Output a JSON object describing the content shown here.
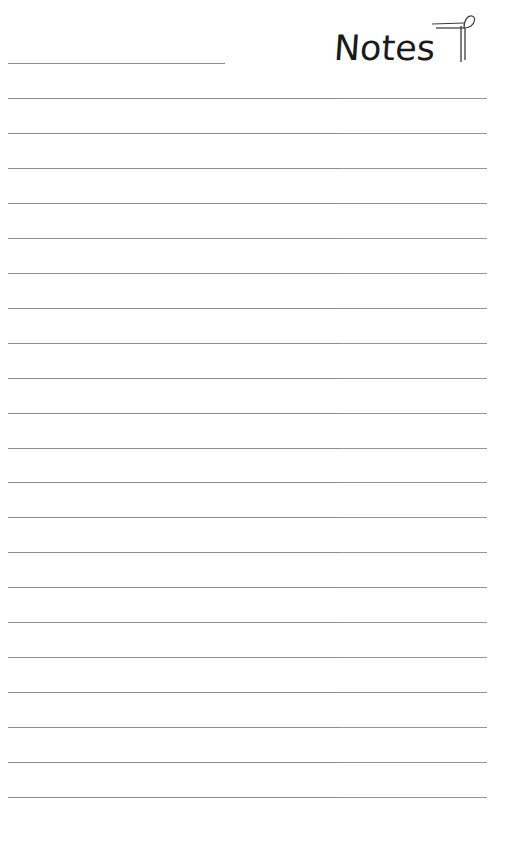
{
  "header": {
    "title": "Notes",
    "name_field": ""
  },
  "icons": {
    "title_ornament": "pilcrow-icon"
  },
  "ruled_lines": {
    "count": 21,
    "first_y": 98,
    "spacing": 34.95,
    "color": "#8c8c8c"
  },
  "lines": [
    "",
    "",
    "",
    "",
    "",
    "",
    "",
    "",
    "",
    "",
    "",
    "",
    "",
    "",
    "",
    "",
    "",
    "",
    "",
    "",
    ""
  ]
}
